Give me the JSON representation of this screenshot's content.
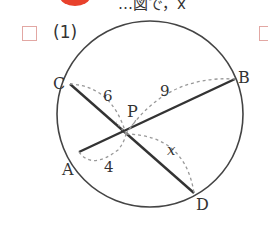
{
  "header": {
    "partial_text": "…図で，x",
    "bullet_color": "#e8412c"
  },
  "problem": {
    "number_label": "(1)",
    "checkbox_color": "#e2a7a3"
  },
  "figure": {
    "points": {
      "A": "A",
      "B": "B",
      "C": "C",
      "D": "D",
      "P": "P"
    },
    "lengths": {
      "CP": "6",
      "PB": "9",
      "AP": "4",
      "PD": "x"
    }
  }
}
